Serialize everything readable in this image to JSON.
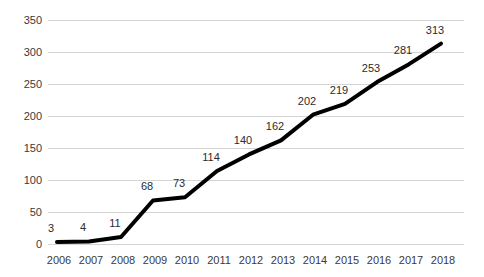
{
  "chart_data": {
    "type": "line",
    "title": "",
    "subtitle": "",
    "xlabel": "",
    "ylabel": "",
    "categories": [
      "2006",
      "2007",
      "2008",
      "2009",
      "2010",
      "2011",
      "2012",
      "2013",
      "2014",
      "2015",
      "2016",
      "2017",
      "2018"
    ],
    "values": [
      3,
      4,
      11,
      68,
      73,
      114,
      140,
      162,
      202,
      219,
      253,
      281,
      313
    ],
    "point_labels": [
      "3",
      "4",
      "11",
      "68",
      "73",
      "114",
      "140",
      "162",
      "202",
      "219",
      "253",
      "281",
      "313"
    ],
    "ylim": [
      0,
      350
    ],
    "y_ticks": [
      0,
      50,
      100,
      150,
      200,
      250,
      300,
      350
    ],
    "y_tick_labels": [
      "0",
      "50",
      "100",
      "150",
      "200",
      "250",
      "300",
      "350"
    ],
    "grid": true,
    "grid_axis": "y",
    "legend": false,
    "legend_position": "none",
    "series": [
      {
        "name": "",
        "values": [
          3,
          4,
          11,
          68,
          73,
          114,
          140,
          162,
          202,
          219,
          253,
          281,
          313
        ]
      }
    ],
    "colors": {
      "line": "#000000",
      "grid": "#d4d4d4",
      "axis_text": "#3a3a3a",
      "label_text": "#2b2b2b",
      "background": "#ffffff"
    },
    "line_width": 4,
    "markers": false
  }
}
